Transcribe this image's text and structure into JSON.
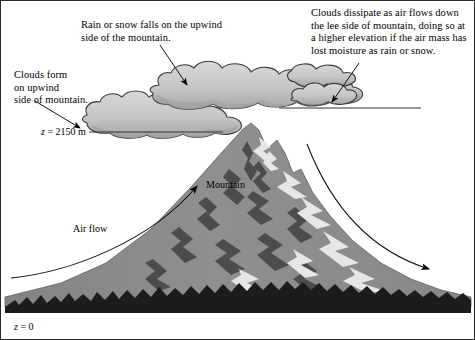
{
  "figure": {
    "background": "#ffffff",
    "border_color": "#2b2b2b"
  },
  "annotations": {
    "rain_snow": "Rain or snow falls on the upwind\nside of the mountain.",
    "dissipate": "Clouds dissipate as air flows down\nthe lee side of mountain, doing so at\na higher elevation if the air mass has\nlost moisture as rain or snow.",
    "clouds_form": "Clouds form\non upwind\nside of mountain."
  },
  "levels": {
    "upper": {
      "variable": "z",
      "equals": " = ",
      "value": "2150 m"
    },
    "ground": {
      "variable": "z",
      "equals": " = ",
      "value": "0"
    }
  },
  "labels": {
    "mountain": "Mountain",
    "air_flow": "Air flow"
  },
  "colors": {
    "cloud_fill": "#c6c6c6",
    "cloud_shadow": "#ababab",
    "cloud_outline": "#3a3a3a",
    "mountain_fill": "#8d8d8d",
    "mountain_rock": "#4a4a4a",
    "mountain_snow": "#e8e8e8",
    "forest": "#1c1c1c",
    "line": "#333333",
    "text": "#000000"
  }
}
